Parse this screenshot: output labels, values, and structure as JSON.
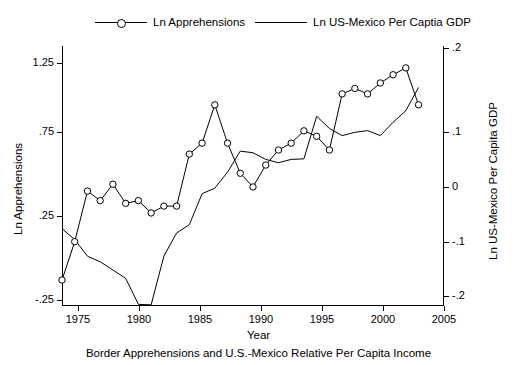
{
  "legend": {
    "items": [
      {
        "label": "Ln Apprehensions",
        "marker": "circle-line",
        "color": "#000000"
      },
      {
        "label": "Ln US-Mexico Per Captia GDP",
        "marker": "line",
        "color": "#000000"
      }
    ]
  },
  "caption": "Border Apprehensions and U.S.-Mexico Relative Per Capita Income",
  "axes": {
    "x_title": "Year",
    "y_left_title": "Ln Apprehensions",
    "y_right_title": "Ln US-Mexico Per Capita GDP",
    "x_ticks": [
      "1975",
      "1980",
      "1985",
      "1990",
      "1995",
      "2000",
      "2005"
    ],
    "y_left_ticks": [
      "-.25",
      ".25",
      ".75",
      "1.25"
    ],
    "y_right_ticks": [
      "-.2",
      "-.1",
      "0",
      ".1",
      ".2"
    ]
  },
  "chart_data": {
    "type": "line",
    "title": "",
    "subtitle": "",
    "xlabel": "Year",
    "ylabel": "Ln Apprehensions",
    "y2label": "Ln US-Mexico Per Capita GDP",
    "xlim": [
      1975,
      2005
    ],
    "ylim": [
      -0.45,
      1.45
    ],
    "y2lim": [
      -0.245,
      0.225
    ],
    "grid": false,
    "legend_position": "top",
    "x": [
      1975,
      1976,
      1977,
      1978,
      1979,
      1980,
      1981,
      1982,
      1983,
      1984,
      1985,
      1986,
      1987,
      1988,
      1989,
      1990,
      1991,
      1992,
      1993,
      1994,
      1995,
      1996,
      1997,
      1998,
      1999,
      2000,
      2001,
      2002,
      2003
    ],
    "series": [
      {
        "name": "Ln Apprehensions",
        "axis": "left",
        "marker": "circle",
        "values": [
          -0.26,
          0.02,
          0.39,
          0.32,
          0.44,
          0.3,
          0.32,
          0.23,
          0.28,
          0.28,
          0.66,
          0.74,
          1.02,
          0.74,
          0.52,
          0.42,
          0.58,
          0.69,
          0.74,
          0.83,
          0.79,
          0.69,
          1.1,
          1.14,
          1.1,
          1.18,
          1.24,
          1.29,
          1.02
        ]
      },
      {
        "name": "Ln US-Mexico Per Captia GDP",
        "axis": "right",
        "marker": "none",
        "values": [
          -0.105,
          -0.125,
          -0.155,
          -0.165,
          -0.18,
          -0.195,
          -0.242,
          -0.243,
          -0.155,
          -0.113,
          -0.098,
          -0.042,
          -0.032,
          -0.003,
          0.035,
          0.032,
          0.02,
          0.014,
          0.02,
          0.021,
          0.098,
          0.076,
          0.063,
          0.069,
          0.072,
          0.063,
          0.087,
          0.108,
          0.15
        ]
      }
    ],
    "annotations": []
  }
}
